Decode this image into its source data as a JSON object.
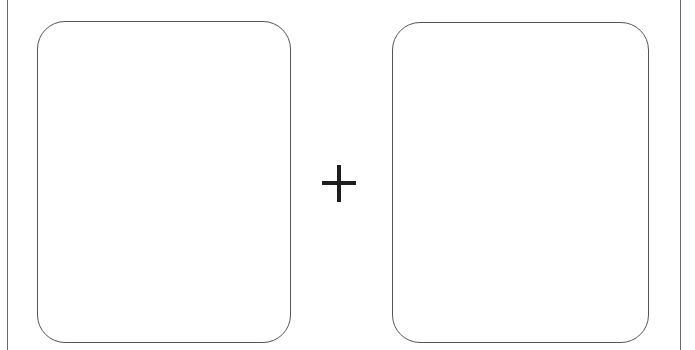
{
  "diagram": {
    "operands": [
      {
        "id": "left",
        "label": ""
      },
      {
        "id": "right",
        "label": ""
      }
    ],
    "operator": {
      "symbol": "+",
      "name": "plus-icon"
    },
    "colors": {
      "card_border": "#555555",
      "operator": "#1e1e1e",
      "frame": "#6a6a6a",
      "background": "#ffffff"
    }
  }
}
